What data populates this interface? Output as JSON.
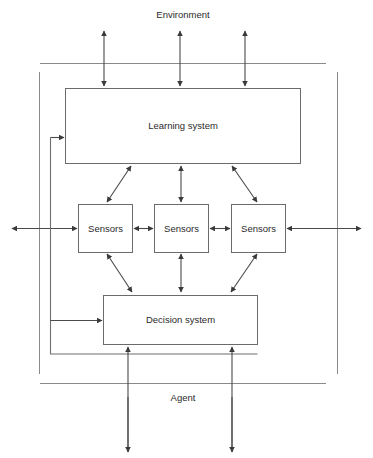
{
  "figure": {
    "type": "block-diagram",
    "background_color": "#ffffff",
    "line_color": "#4a4a4a",
    "box_stroke_color": "#6b6b6b",
    "boundary_color": "#8a8a8a",
    "text_color": "#2b2b2b"
  },
  "regions": {
    "environment": {
      "label": "Environment"
    },
    "agent": {
      "label": "Agent"
    }
  },
  "blocks": {
    "learning_system": {
      "label": "Learning system"
    },
    "sensor_left": {
      "label": "Sensors"
    },
    "sensor_middle": {
      "label": "Sensors"
    },
    "sensor_right": {
      "label": "Sensors"
    },
    "decision_system": {
      "label": "Decision system"
    }
  },
  "connections": {
    "env_to_learning": {
      "label": "",
      "count": 3,
      "style": "double-headed vertical arrows"
    },
    "learning_to_sensors": {
      "label": "",
      "count": 3,
      "style": "double-headed arrows"
    },
    "sensors_chain": {
      "label": "",
      "count": 2,
      "style": "double-headed horizontal arrows"
    },
    "sensors_lateral_out": {
      "label": "",
      "count": 2,
      "style": "double-headed horizontal arrows crossing agent boundary"
    },
    "sensors_to_decision": {
      "label": "",
      "count": 3,
      "style": "double-headed arrows"
    },
    "decision_to_env": {
      "label": "",
      "count": 2,
      "style": "upward arrows from outside agent boundary"
    },
    "decision_feedback_to_learning": {
      "label": "",
      "count": 1,
      "style": "single arrow via left routing"
    },
    "feedback_into_decision": {
      "label": "",
      "count": 1,
      "style": "single arrow via left routing"
    }
  }
}
